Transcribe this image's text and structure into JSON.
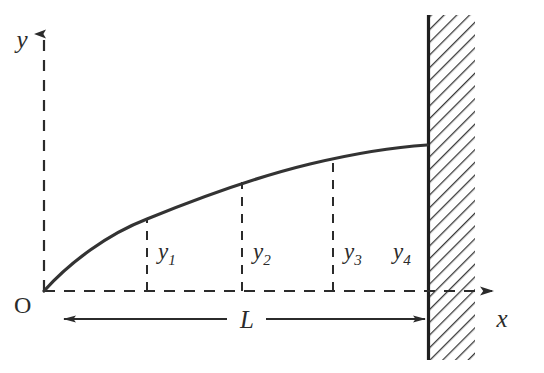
{
  "figure": {
    "background_color": "#ffffff",
    "line_color": "#2b2b2b",
    "curve_color": "#333333",
    "hatch_color": "#3a3a3a",
    "width": 544,
    "height": 373
  },
  "axes": {
    "y_axis": {
      "label": "y",
      "style": "dashed",
      "arrow": "up",
      "x": 44,
      "y_top": 28,
      "y_bottom": 291
    },
    "x_axis": {
      "label": "x",
      "style": "dashed",
      "arrow": "right",
      "y": 291,
      "x_left": 44,
      "x_right": 498
    },
    "origin": {
      "label": "O",
      "x": 44,
      "y": 291
    }
  },
  "curve": {
    "name": "deflection-curve",
    "start": [
      44,
      291
    ],
    "end": [
      427,
      145
    ],
    "shape": "concave-down",
    "points": [
      [
        44,
        291
      ],
      [
        75,
        264
      ],
      [
        110,
        240
      ],
      [
        147,
        219
      ],
      [
        190,
        200
      ],
      [
        242,
        182
      ],
      [
        290,
        170
      ],
      [
        333,
        160
      ],
      [
        380,
        151
      ],
      [
        427,
        145
      ]
    ]
  },
  "ordinates": [
    {
      "label": "y",
      "subscript": "1",
      "x": 147,
      "y_top": 219,
      "y_bottom": 291,
      "label_x": 158,
      "label_y": 257
    },
    {
      "label": "y",
      "subscript": "2",
      "x": 242,
      "y_top": 182,
      "y_bottom": 291,
      "label_x": 253,
      "label_y": 257
    },
    {
      "label": "y",
      "subscript": "3",
      "x": 333,
      "y_top": 160,
      "y_bottom": 291,
      "label_x": 344,
      "label_y": 257
    },
    {
      "label": "y",
      "subscript": "4",
      "x": 427,
      "y_top": 145,
      "y_bottom": 291,
      "label_x": 398,
      "label_y": 257
    }
  ],
  "dimension": {
    "label": "L",
    "y": 319,
    "x_start": 62,
    "x_end": 427,
    "label_x": 247,
    "label_y": 326,
    "arrow_heads": "both"
  },
  "wall": {
    "name": "fixed-support-wall",
    "x": 427,
    "width": 48,
    "y_top": 15,
    "y_bottom": 360,
    "hatch": "diagonal",
    "edge_thickness": 3
  }
}
